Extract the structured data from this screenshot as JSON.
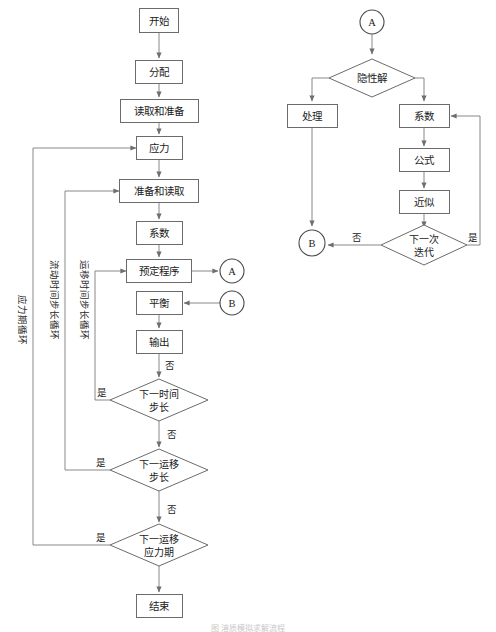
{
  "figure": {
    "caption": "图   溶质模拟求解流程",
    "arrow_color": "#7a7a7a",
    "box_stroke_color": "#6b6b6b",
    "text_color": "#1b1b1b"
  },
  "left_flowchart": {
    "name": "主流程",
    "nodes": {
      "start": {
        "label": "开始",
        "shape": "box",
        "x": 159,
        "y": 20,
        "w": 39,
        "h": 24
      },
      "allocate": {
        "label": "分配",
        "shape": "box",
        "x": 159,
        "y": 72,
        "w": 47,
        "h": 23
      },
      "read_prepare": {
        "label": "读取和准备",
        "shape": "box",
        "x": 159,
        "y": 111,
        "w": 78,
        "h": 23
      },
      "stress": {
        "label": "应力",
        "shape": "box",
        "x": 159,
        "y": 148,
        "w": 46,
        "h": 23
      },
      "prepare_read": {
        "label": "准备和读取",
        "shape": "box",
        "x": 159,
        "y": 191,
        "w": 79,
        "h": 23
      },
      "coefficient": {
        "label": "系数",
        "shape": "box",
        "x": 159,
        "y": 233,
        "w": 46,
        "h": 23
      },
      "preset_program": {
        "label": "预定程序",
        "shape": "box",
        "x": 159,
        "y": 271,
        "w": 65,
        "h": 23
      },
      "balance": {
        "label": "平衡",
        "shape": "box",
        "x": 159,
        "y": 303,
        "w": 46,
        "h": 23
      },
      "output": {
        "label": "输出",
        "shape": "box",
        "x": 159,
        "y": 342,
        "w": 46,
        "h": 23
      },
      "end": {
        "label": "结束",
        "shape": "box",
        "x": 159,
        "y": 606,
        "w": 46,
        "h": 23
      },
      "connector_a": {
        "label": "A",
        "shape": "circle",
        "x": 232,
        "y": 271,
        "r": 12
      },
      "connector_b": {
        "label": "B",
        "shape": "circle",
        "x": 232,
        "y": 303,
        "r": 12
      }
    },
    "decisions": [
      {
        "id": "next_time_step",
        "line1": "下一时间",
        "line2": "步长",
        "x": 159,
        "y": 400,
        "w": 98,
        "h": 42
      },
      {
        "id": "next_transport_step",
        "line1": "下一运移",
        "line2": "步长",
        "x": 159,
        "y": 470,
        "w": 98,
        "h": 42
      },
      {
        "id": "next_transport_stress",
        "line1": "下一运移",
        "line2": "应力期",
        "x": 159,
        "y": 545,
        "w": 98,
        "h": 42
      }
    ],
    "edge_labels": {
      "no_1": "否",
      "no_2": "否",
      "no_3": "否",
      "yes_1": "是",
      "yes_2": "是",
      "yes_3": "是"
    },
    "loop_labels": [
      {
        "id": "stress_period_loop",
        "text": "应力期循环",
        "x": 22,
        "y": 320
      },
      {
        "id": "flow_time_step_loop",
        "text": "流动时间步长循环",
        "x": 54,
        "y": 300
      },
      {
        "id": "transport_time_step_loop",
        "text": "运移时间步长循环",
        "x": 84,
        "y": 300
      }
    ]
  },
  "right_flowchart": {
    "name": "迭代子流程",
    "nodes": {
      "connector_a_in": {
        "label": "A",
        "shape": "circle",
        "x": 372,
        "y": 22,
        "r": 12
      },
      "process": {
        "label": "处理",
        "shape": "box",
        "x": 312,
        "y": 116,
        "w": 50,
        "h": 23
      },
      "coefficient": {
        "label": "系数",
        "shape": "box",
        "x": 424,
        "y": 116,
        "w": 50,
        "h": 23
      },
      "formula": {
        "label": "公式",
        "shape": "box",
        "x": 424,
        "y": 160,
        "w": 50,
        "h": 23
      },
      "approximation": {
        "label": "近似",
        "shape": "box",
        "x": 424,
        "y": 202,
        "w": 50,
        "h": 23
      },
      "connector_b_out": {
        "label": "B",
        "shape": "circle",
        "x": 312,
        "y": 243,
        "r": 13
      }
    },
    "decisions": [
      {
        "id": "implicit_solution",
        "line1": "隐性解",
        "line2": "",
        "x": 372,
        "y": 78,
        "w": 86,
        "h": 38
      },
      {
        "id": "next_iteration",
        "line1": "下一次",
        "line2": "迭代",
        "x": 424,
        "y": 245,
        "w": 86,
        "h": 40
      }
    ],
    "edge_labels": {
      "no_iteration": "否",
      "yes_iteration": "是"
    }
  }
}
